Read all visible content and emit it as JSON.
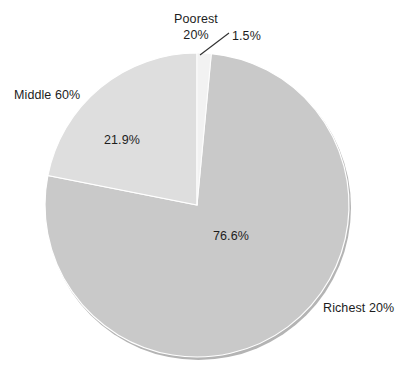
{
  "chart_data": {
    "type": "pie",
    "title": "",
    "subtitle": "",
    "xlabel": "",
    "ylabel": "",
    "legend_position": "none",
    "grid": false,
    "categories": [
      "Poorest 20%",
      "Middle 60%",
      "Richest 20%"
    ],
    "values": [
      1.5,
      21.9,
      76.6
    ],
    "value_labels": [
      "1.5%",
      "21.9%",
      "76.6%"
    ],
    "slices": [
      {
        "name": "Poorest 20%",
        "value": 1.5,
        "value_label": "1.5%",
        "color": "#f2f2f2",
        "start_angle_deg": 0,
        "end_angle_deg": 5.4,
        "label_placement": "outside-callout"
      },
      {
        "name": "Richest 20%",
        "value": 76.6,
        "value_label": "76.6%",
        "color": "#c9c9c9",
        "start_angle_deg": 5.4,
        "end_angle_deg": 281.2,
        "label_placement": "outside-right"
      },
      {
        "name": "Middle 60%",
        "value": 21.9,
        "value_label": "21.9%",
        "color": "#dedede",
        "start_angle_deg": 281.2,
        "end_angle_deg": 360,
        "label_placement": "outside-left"
      }
    ]
  },
  "labels": {
    "poorest_line1": "Poorest",
    "poorest_line2": "20%",
    "poorest_value": "1.5%",
    "middle": "Middle 60%",
    "middle_value": "21.9%",
    "richest": "Richest 20%",
    "richest_value": "76.6%"
  },
  "colors": {
    "background": "#ffffff",
    "text": "#1d1d1d",
    "poorest_slice": "#f2f2f2",
    "middle_slice": "#dedede",
    "richest_slice": "#c9c9c9",
    "slice_edge": "#ffffff",
    "pie_rim": "#b4b4b4",
    "leader_line": "#303030"
  }
}
